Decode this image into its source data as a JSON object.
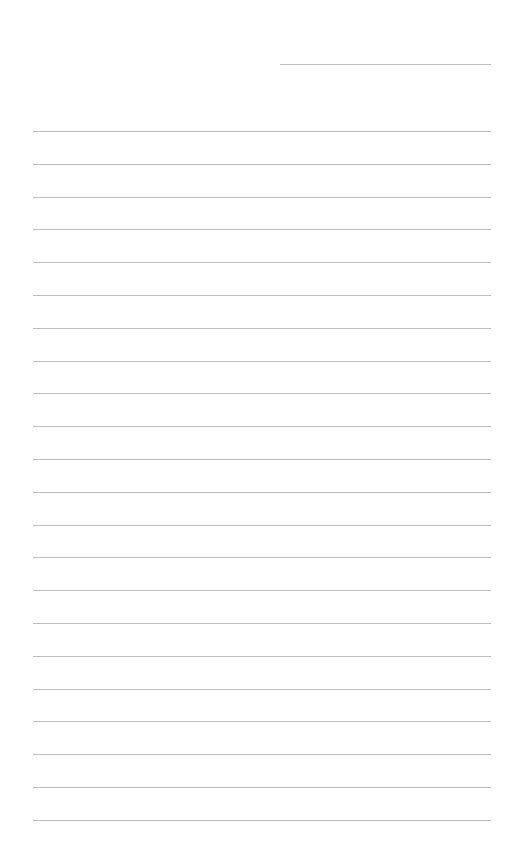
{
  "page": {
    "type": "lined-paper",
    "background_color": "#ffffff",
    "line_color": "#bdbdbd",
    "date_line": {
      "present": true
    },
    "ruled_lines": {
      "count": 22,
      "first_y": 131,
      "spacing": 32.8
    }
  }
}
